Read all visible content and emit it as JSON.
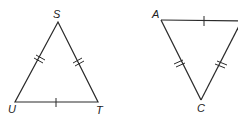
{
  "figures": [
    {
      "name": "triangle-SUT",
      "vertices": [
        {
          "label": "S",
          "x": 58,
          "y": 22,
          "lx": 53,
          "ly": 18
        },
        {
          "label": "U",
          "x": 15,
          "y": 102,
          "lx": 8,
          "ly": 113
        },
        {
          "label": "T",
          "x": 98,
          "y": 102,
          "lx": 96,
          "ly": 114
        }
      ],
      "congruence_marks": {
        "SU": 2,
        "ST": 2,
        "UT": 1
      }
    },
    {
      "name": "triangle-ABC",
      "vertices": [
        {
          "label": "A",
          "x": 161,
          "y": 20,
          "lx": 152,
          "ly": 18
        },
        {
          "label": "B",
          "x": 280,
          "y": 20,
          "lx": null,
          "ly": null
        },
        {
          "label": "C",
          "x": 201,
          "y": 100,
          "lx": 197,
          "ly": 112
        }
      ],
      "congruence_marks": {
        "AB": 1,
        "AC": 2,
        "BC": 2
      }
    }
  ],
  "labels": {
    "S": "S",
    "U": "U",
    "T": "T",
    "A": "A",
    "C": "C"
  }
}
